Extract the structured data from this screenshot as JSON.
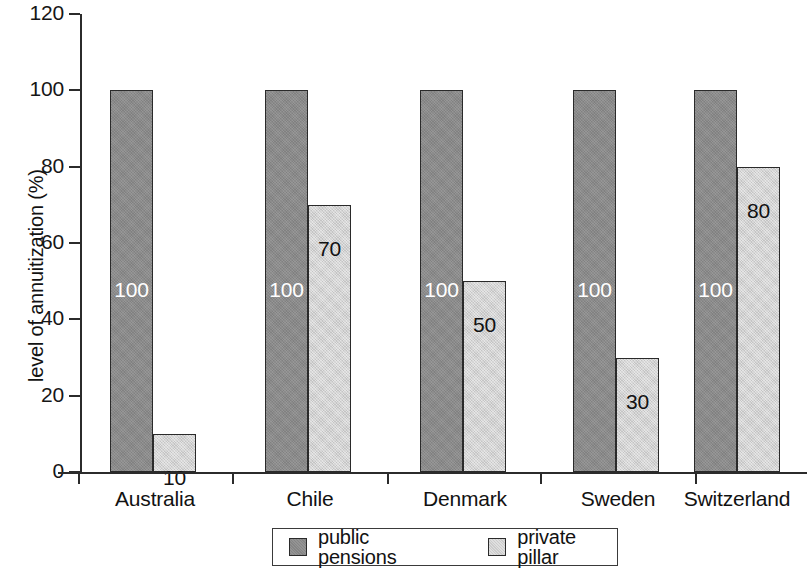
{
  "chart_data": {
    "type": "bar",
    "title": "",
    "xlabel": "",
    "ylabel": "level of annuitization (%)",
    "categories": [
      "Australia",
      "Chile",
      "Denmark",
      "Sweden",
      "Switzerland"
    ],
    "series": [
      {
        "name": "public pensions",
        "color": "#8d8d8d",
        "values": [
          100,
          100,
          100,
          100,
          100
        ]
      },
      {
        "name": "private pillar",
        "color": "#d7d7d7",
        "values": [
          10,
          70,
          50,
          30,
          80
        ]
      }
    ],
    "ylim": [
      0,
      120
    ],
    "yticks": [
      0,
      20,
      40,
      60,
      80,
      100,
      120
    ],
    "ytick_labels": [
      "0",
      "20",
      "40",
      "60",
      "80",
      "100",
      "120"
    ],
    "bar_value_labels": [
      [
        "100",
        "10"
      ],
      [
        "100",
        "70"
      ],
      [
        "100",
        "50"
      ],
      [
        "100",
        "30"
      ],
      [
        "100",
        "80"
      ]
    ],
    "grid": false,
    "legend_position": "bottom-center"
  },
  "legend": {
    "items": [
      {
        "label": "public pensions",
        "swatch": "dark-gray-swatch-icon"
      },
      {
        "label": "private pillar",
        "swatch": "light-gray-swatch-icon"
      }
    ]
  }
}
